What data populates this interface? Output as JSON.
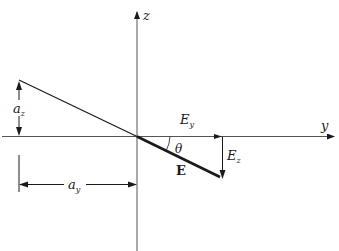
{
  "diagram": {
    "type": "vector-decomposition",
    "axes": {
      "z_label": "z",
      "y_label": "y"
    },
    "vector": {
      "label": "E",
      "angle_label": "θ",
      "components": {
        "horizontal": {
          "label": "E",
          "subscript": "y"
        },
        "vertical": {
          "label": "E",
          "subscript": "z"
        }
      }
    },
    "dimensions": {
      "vertical": {
        "label": "a",
        "subscript": "z"
      },
      "horizontal": {
        "label": "a",
        "subscript": "y"
      }
    },
    "colors": {
      "ink": "#1a1a1a",
      "axis": "#555555",
      "background": "#ffffff"
    }
  }
}
